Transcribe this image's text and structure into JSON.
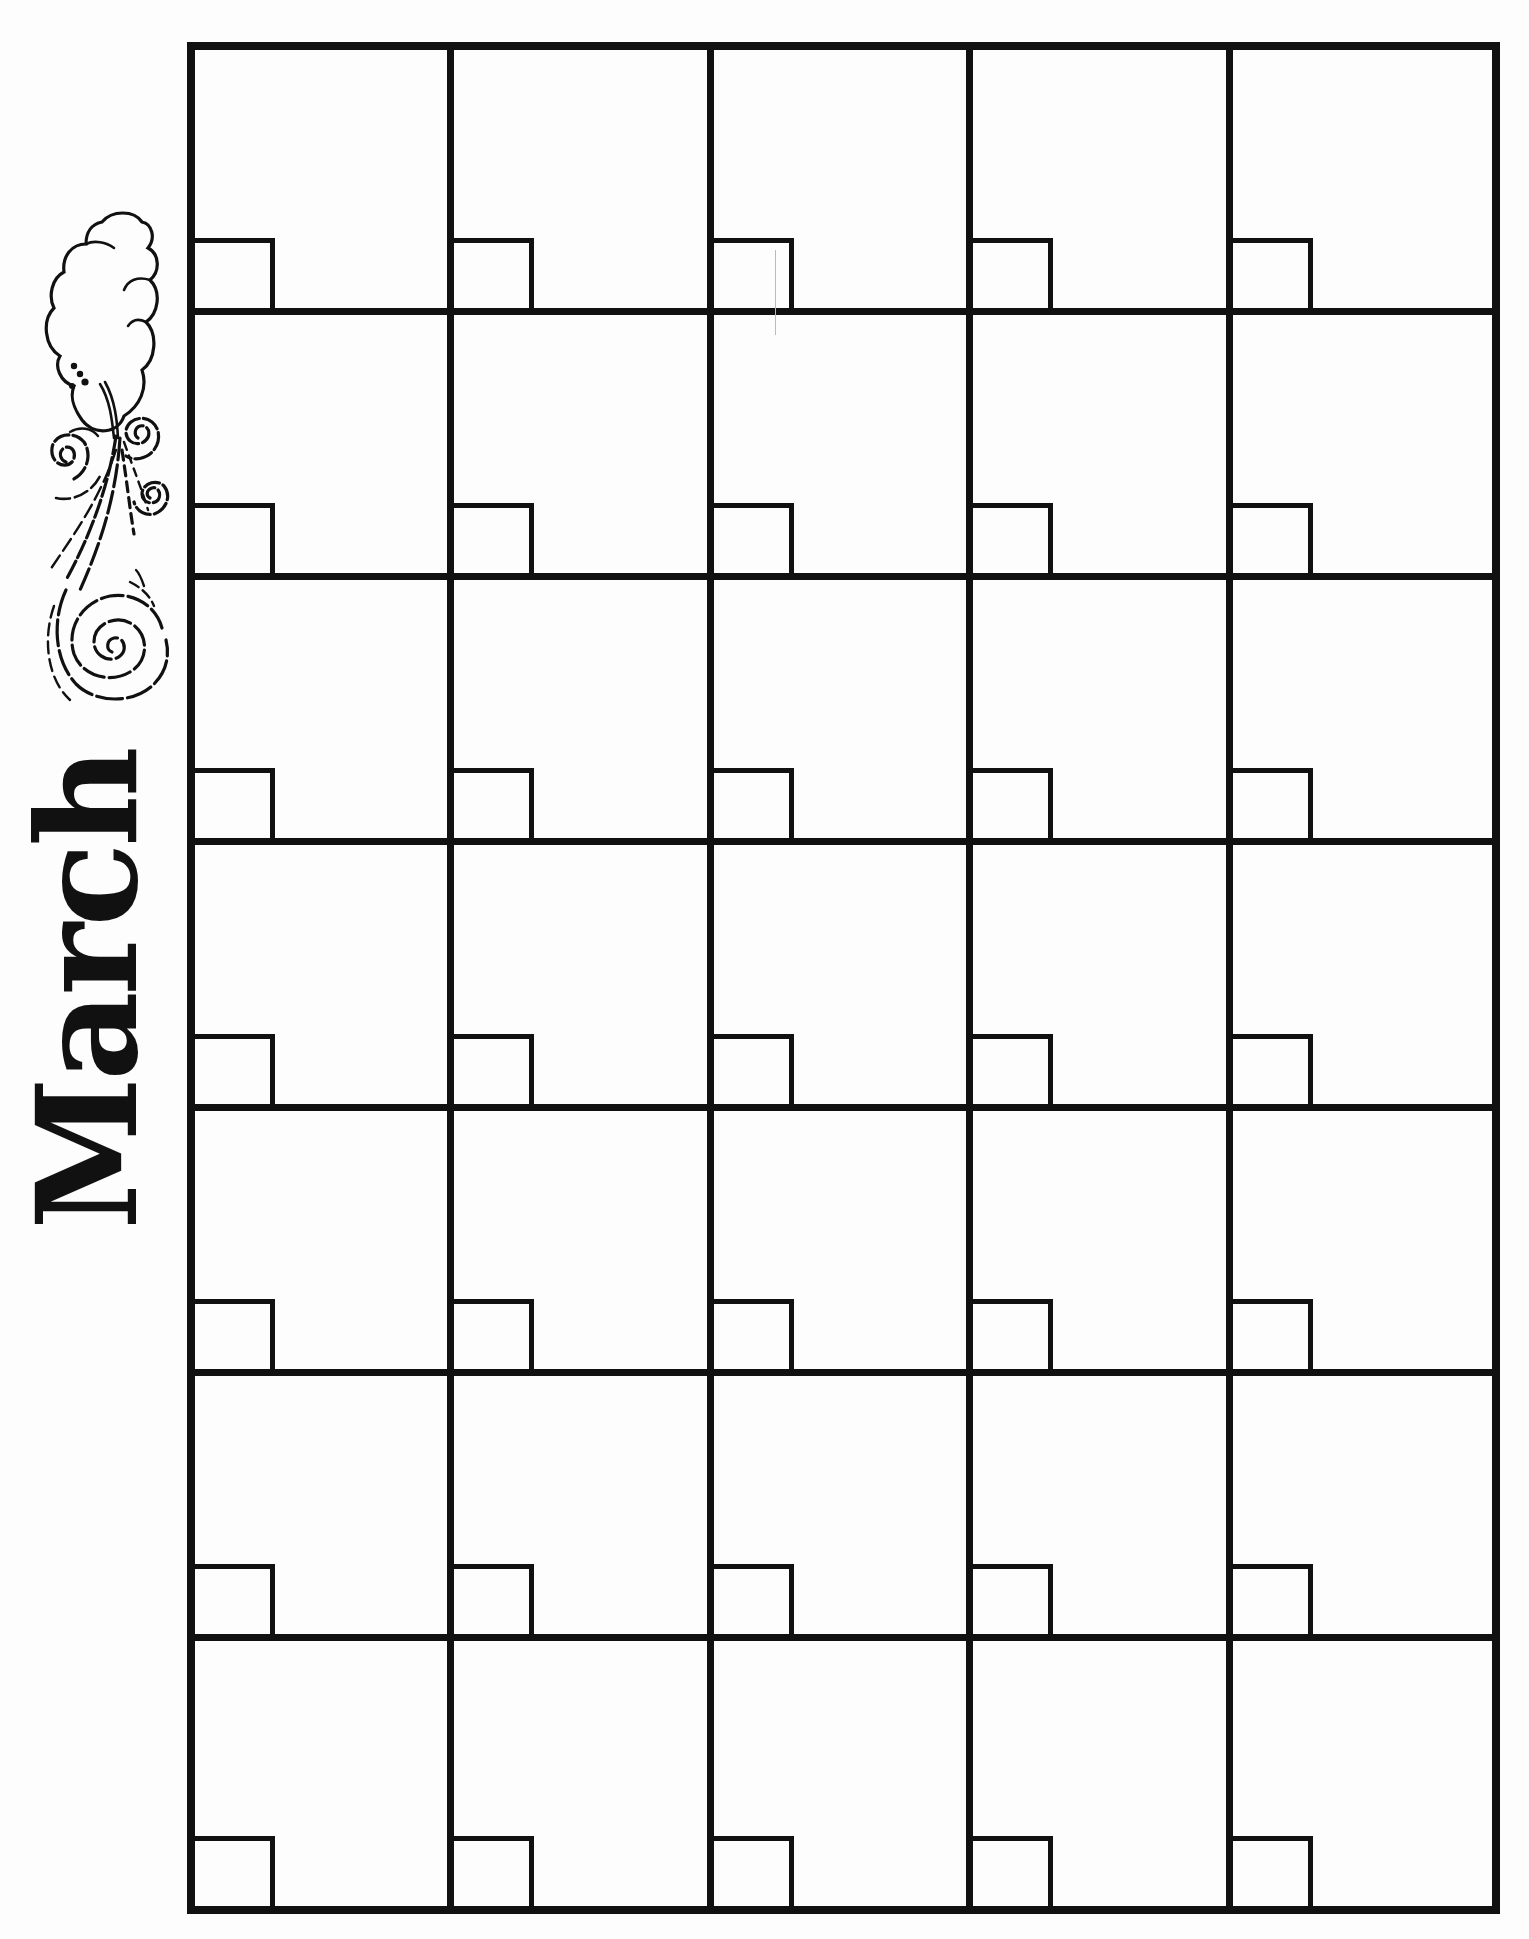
{
  "calendar": {
    "month_title": "March",
    "illustration": "wind-cloud-icon",
    "columns": 5,
    "rows": 7,
    "cells": [
      {
        "date": ""
      },
      {
        "date": ""
      },
      {
        "date": ""
      },
      {
        "date": ""
      },
      {
        "date": ""
      },
      {
        "date": ""
      },
      {
        "date": ""
      },
      {
        "date": ""
      },
      {
        "date": ""
      },
      {
        "date": ""
      },
      {
        "date": ""
      },
      {
        "date": ""
      },
      {
        "date": ""
      },
      {
        "date": ""
      },
      {
        "date": ""
      },
      {
        "date": ""
      },
      {
        "date": ""
      },
      {
        "date": ""
      },
      {
        "date": ""
      },
      {
        "date": ""
      },
      {
        "date": ""
      },
      {
        "date": ""
      },
      {
        "date": ""
      },
      {
        "date": ""
      },
      {
        "date": ""
      },
      {
        "date": ""
      },
      {
        "date": ""
      },
      {
        "date": ""
      },
      {
        "date": ""
      },
      {
        "date": ""
      },
      {
        "date": ""
      },
      {
        "date": ""
      },
      {
        "date": ""
      },
      {
        "date": ""
      },
      {
        "date": ""
      }
    ]
  },
  "colors": {
    "ink": "#111111",
    "paper": "#fdfdfd"
  }
}
